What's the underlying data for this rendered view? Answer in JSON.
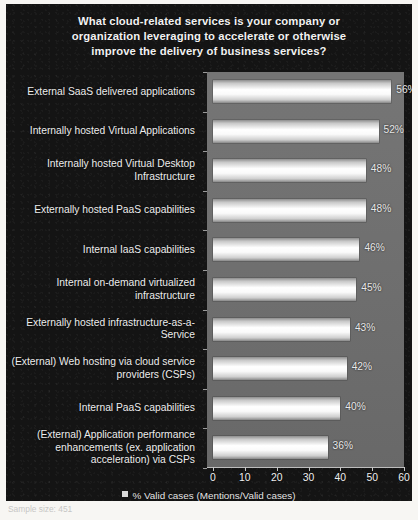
{
  "chart_data": {
    "type": "bar",
    "orientation": "horizontal",
    "title_lines": [
      "What cloud-related services is your company or",
      "organization leveraging to accelerate or otherwise",
      "improve the delivery of business services?"
    ],
    "categories": [
      "External SaaS delivered applications",
      "Internally hosted Virtual Applications",
      "Internally hosted Virtual Desktop Infrastructure",
      "Externally hosted PaaS capabilities",
      "Internal IaaS capabilities",
      "Internal on-demand virtualized infrastructure",
      "Externally hosted infrastructure-as-a-Service",
      "(External) Web hosting via cloud service providers (CSPs)",
      "Internal PaaS capabilities",
      "(External) Application performance enhancements (ex. application acceleration) via CSPs"
    ],
    "category_lines": [
      [
        "External SaaS delivered applications"
      ],
      [
        "Internally hosted Virtual Applications"
      ],
      [
        "Internally hosted Virtual Desktop",
        "Infrastructure"
      ],
      [
        "Externally hosted PaaS capabilities"
      ],
      [
        "Internal IaaS capabilities"
      ],
      [
        "Internal on-demand virtualized",
        "infrastructure"
      ],
      [
        "Externally hosted infrastructure-as-a-",
        "Service"
      ],
      [
        "(External) Web hosting via cloud service",
        "providers (CSPs)"
      ],
      [
        "Internal PaaS capabilities"
      ],
      [
        "(External) Application performance",
        "enhancements (ex. application",
        "acceleration) via CSPs"
      ]
    ],
    "values": [
      56,
      52,
      48,
      48,
      46,
      45,
      43,
      42,
      40,
      36
    ],
    "value_labels": [
      "56%",
      "52%",
      "48%",
      "48%",
      "46%",
      "45%",
      "43%",
      "42%",
      "40%",
      "36%"
    ],
    "xlabel": "",
    "ylabel": "",
    "xlim": [
      0,
      60
    ],
    "xticks": [
      0,
      10,
      20,
      30,
      40,
      50,
      60
    ],
    "xtick_labels": [
      "0",
      "10",
      "20",
      "30",
      "40",
      "50",
      "60"
    ],
    "grid": false,
    "legend_position": "bottom",
    "legend": [
      {
        "label": "% Valid cases (Mentions/Valid cases)",
        "color": "#d9d9d9"
      }
    ],
    "series": [
      {
        "name": "% Valid cases (Mentions/Valid cases)",
        "values": [
          56,
          52,
          48,
          48,
          46,
          45,
          43,
          42,
          40,
          36
        ]
      }
    ],
    "colors": {
      "panel_background": "#141414",
      "plot_background": "#6e6e6e",
      "bar_fill": "#ffffff",
      "text": "#ededed",
      "axis": "#bdbdbd"
    }
  },
  "legend": {
    "entry": "% Valid cases (Mentions/Valid cases)"
  },
  "footer": {
    "caption": "Sample size: 451"
  }
}
